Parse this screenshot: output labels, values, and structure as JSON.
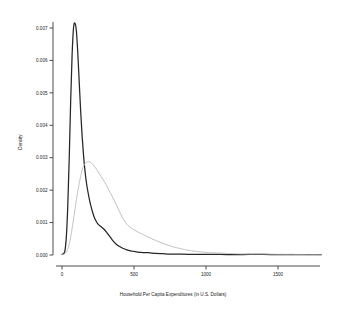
{
  "chart_data": {
    "type": "line",
    "title": "",
    "xlabel": "Household Per Capita Expenditures (in U.S. Dollars)",
    "ylabel": "Density",
    "xlim": [
      -60,
      1800
    ],
    "ylim": [
      0,
      0.0075
    ],
    "grid": false,
    "legend": "none",
    "xticks": [
      0,
      500,
      1000,
      1500
    ],
    "xticklabels": [
      "0",
      "500",
      "1000",
      "1500"
    ],
    "yticks": [
      0.0,
      0.001,
      0.002,
      0.003,
      0.004,
      0.005,
      0.006,
      0.007
    ],
    "yticklabels": [
      "0.000",
      "0.001",
      "0.002",
      "0.003",
      "0.004",
      "0.005",
      "0.006",
      "0.007"
    ],
    "series": [
      {
        "name": "solid-density",
        "style": "solid",
        "color": "#262626",
        "x": [
          0,
          10,
          20,
          30,
          40,
          50,
          60,
          70,
          80,
          90,
          100,
          110,
          120,
          130,
          140,
          150,
          160,
          170,
          180,
          190,
          200,
          215,
          230,
          250,
          270,
          290,
          310,
          330,
          350,
          375,
          400,
          425,
          450,
          475,
          500,
          525,
          550,
          575,
          600,
          650,
          700,
          750,
          800,
          900,
          1000,
          1100,
          1200,
          1300,
          1400,
          1500,
          1600,
          1700,
          1800
        ],
        "y": [
          2e-05,
          4e-05,
          0.00012,
          0.00055,
          0.0015,
          0.00295,
          0.0047,
          0.00615,
          0.007,
          0.00715,
          0.0069,
          0.0062,
          0.0053,
          0.0044,
          0.00365,
          0.00305,
          0.00258,
          0.00222,
          0.00195,
          0.00172,
          0.00152,
          0.00128,
          0.0011,
          0.00095,
          0.00088,
          0.0008,
          0.0007,
          0.00058,
          0.00046,
          0.00034,
          0.00026,
          0.0002,
          0.00016,
          0.00013,
          0.00011,
          9e-05,
          8e-05,
          7e-05,
          7e-05,
          5e-05,
          4e-05,
          3e-05,
          3e-05,
          2e-05,
          2e-05,
          2e-05,
          1e-05,
          2e-05,
          2e-05,
          1e-05,
          1e-05,
          1e-05,
          1e-05
        ]
      },
      {
        "name": "dotted-density",
        "style": "dotted",
        "color": "#b6b6b6",
        "x": [
          0,
          20,
          40,
          60,
          80,
          100,
          120,
          140,
          160,
          180,
          200,
          220,
          240,
          260,
          280,
          300,
          320,
          340,
          360,
          380,
          400,
          425,
          450,
          475,
          500,
          530,
          560,
          600,
          650,
          700,
          750,
          800,
          850,
          900,
          1000,
          1100,
          1200,
          1300,
          1400,
          1500,
          1600,
          1700,
          1800
        ],
        "y": [
          1e-05,
          4e-05,
          0.00018,
          0.00055,
          0.0011,
          0.0017,
          0.00222,
          0.00262,
          0.00282,
          0.00288,
          0.00285,
          0.00276,
          0.00264,
          0.0025,
          0.00236,
          0.00222,
          0.00205,
          0.00188,
          0.0017,
          0.00152,
          0.00133,
          0.00112,
          0.00095,
          0.00085,
          0.00078,
          0.0007,
          0.00064,
          0.00055,
          0.00045,
          0.00036,
          0.00028,
          0.00022,
          0.00017,
          0.00013,
          8e-05,
          6e-05,
          4e-05,
          3e-05,
          3e-05,
          2e-05,
          2e-05,
          1e-05,
          1e-05
        ]
      }
    ]
  }
}
